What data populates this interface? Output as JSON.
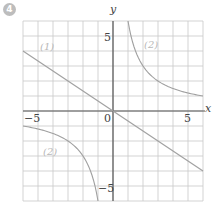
{
  "badge": "4",
  "axes": {
    "x_label": "x",
    "y_label": "y",
    "origin_label": "0",
    "x_tick_neg": "−5",
    "x_tick_pos": "5",
    "y_tick_pos": "5",
    "y_tick_neg": "−5"
  },
  "curve_labels": {
    "line": "(1)",
    "hyperbola_upper": "(2)",
    "hyperbola_lower": "(2)"
  },
  "colors": {
    "grid": "#c8c8c8",
    "axis": "#555555",
    "curve": "#a0a0a0"
  },
  "chart_data": {
    "type": "line",
    "title": "",
    "xlabel": "x",
    "ylabel": "y",
    "xlim": [
      -6,
      6
    ],
    "ylim": [
      -6,
      6
    ],
    "grid": true,
    "ticks_labeled": {
      "x": [
        -5,
        0,
        5
      ],
      "y": [
        5,
        -5
      ]
    },
    "series": [
      {
        "name": "(1)",
        "kind": "line",
        "equation": "y = -2/3 x",
        "points": [
          [
            -6,
            4
          ],
          [
            -3,
            2
          ],
          [
            0,
            0
          ],
          [
            3,
            -2
          ],
          [
            6,
            -4
          ]
        ]
      },
      {
        "name": "(2)",
        "kind": "hyperbola",
        "equation": "y = 6/x",
        "points": [
          [
            1,
            6
          ],
          [
            2,
            3
          ],
          [
            3,
            2
          ],
          [
            4,
            1.5
          ],
          [
            6,
            1
          ],
          [
            -1,
            -6
          ],
          [
            -2,
            -3
          ],
          [
            -3,
            -2
          ],
          [
            -4,
            -1.5
          ],
          [
            -6,
            -1
          ]
        ]
      }
    ]
  }
}
